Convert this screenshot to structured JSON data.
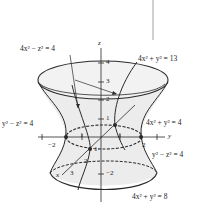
{
  "figure": {
    "labels": {
      "trace_xz": "4x² − z² = 4",
      "trace_top": "4x² + y² = 13",
      "trace_yz_left": "y² − z² = 4",
      "trace_middle": "4x² + y² = 4",
      "trace_yz_right": "y² − z² = 4",
      "trace_bottom": "4x² + y² = 8"
    },
    "axes": {
      "z_label": "z",
      "y_label": "y",
      "x_label": "x",
      "z_ticks": [
        "4",
        "3",
        "2",
        "1",
        "−2"
      ],
      "y_ticks": [
        "−2",
        "1",
        "1",
        "2"
      ],
      "x_ticks": [
        "1",
        "2",
        "3"
      ]
    },
    "colors": {
      "surface_fill": "#ececec",
      "line": "#2a2a2a",
      "background": "#ffffff"
    }
  }
}
